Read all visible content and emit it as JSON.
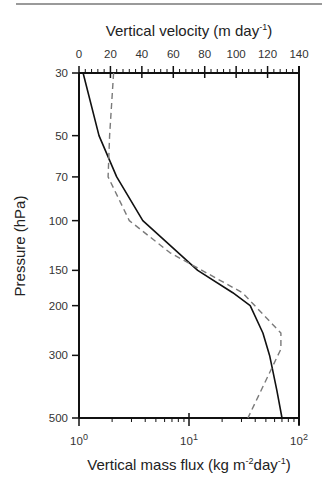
{
  "chart_data": {
    "type": "line",
    "title": "",
    "top_axis": {
      "label": "Vertical velocity (m day",
      "label_sup": "-1",
      "label_end": ")",
      "range": [
        0,
        140
      ],
      "ticks": [
        0,
        20,
        40,
        60,
        80,
        100,
        120,
        140
      ],
      "tick_labels": [
        "0",
        "20",
        "40",
        "60",
        "80",
        "100",
        "120",
        "140"
      ]
    },
    "bottom_axis": {
      "label": "Vertical mass flux (kg m",
      "label_sup1": "-2",
      "label_mid": "day",
      "label_sup2": "-1",
      "label_end": ")",
      "scale": "log",
      "range": [
        1,
        100
      ],
      "ticks": [
        1,
        10,
        100
      ],
      "tick_labels": [
        {
          "base": "10",
          "exp": "0"
        },
        {
          "base": "10",
          "exp": "1"
        },
        {
          "base": "10",
          "exp": "2"
        }
      ]
    },
    "y_axis": {
      "label": "Pressure (hPa)",
      "scale": "log",
      "inverted": true,
      "range": [
        30,
        500
      ],
      "ticks": [
        30,
        50,
        70,
        100,
        150,
        200,
        300,
        500
      ],
      "tick_labels": [
        "30",
        "50",
        "70",
        "100",
        "150",
        "200",
        "300",
        "500"
      ]
    },
    "grid": false,
    "legend": null,
    "series": [
      {
        "name": "Vertical mass flux",
        "axis": "bottom",
        "style": "solid",
        "color": "#111111",
        "pressure": [
          30,
          50,
          70,
          100,
          150,
          180,
          200,
          250,
          300,
          400,
          500
        ],
        "values": [
          1.09,
          1.52,
          2.2,
          3.8,
          12,
          25,
          36,
          47,
          54,
          63,
          70
        ]
      },
      {
        "name": "Vertical velocity",
        "axis": "top",
        "style": "dashed",
        "color": "#7a7a7a",
        "pressure": [
          30,
          50,
          70,
          100,
          130,
          180,
          250,
          285,
          500
        ],
        "values": [
          22,
          19.5,
          18.5,
          32,
          58,
          104,
          128.5,
          128.5,
          107.5
        ]
      }
    ]
  }
}
